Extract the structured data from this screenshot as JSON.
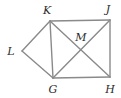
{
  "figure": {
    "type": "geometry-diagram",
    "width": 121,
    "height": 98,
    "background_color": "#ffffff",
    "stroke_color": "#8a8a8a",
    "stroke_width": 1.4,
    "label_color": "#2b2b2b",
    "points": [
      {
        "name": "K",
        "label": "K",
        "x": 50,
        "y": 21,
        "label_x": 47,
        "label_y": 10
      },
      {
        "name": "J",
        "label": "J",
        "x": 110,
        "y": 20,
        "label_x": 108,
        "label_y": 9
      },
      {
        "name": "L",
        "label": "L",
        "x": 22,
        "y": 51,
        "label_x": 11,
        "label_y": 51
      },
      {
        "name": "M",
        "label": "M",
        "x": 81,
        "y": 49,
        "label_x": 81,
        "label_y": 37
      },
      {
        "name": "G",
        "label": "G",
        "x": 53,
        "y": 78,
        "label_x": 53,
        "label_y": 89
      },
      {
        "name": "H",
        "label": "H",
        "x": 110,
        "y": 77,
        "label_x": 110,
        "label_y": 89
      }
    ],
    "segments": [
      {
        "name": "segment-KJ",
        "from": "K",
        "to": "J",
        "x1": 50,
        "y1": 21,
        "x2": 110,
        "y2": 20
      },
      {
        "name": "segment-JH",
        "from": "J",
        "to": "H",
        "x1": 110,
        "y1": 20,
        "x2": 110,
        "y2": 77
      },
      {
        "name": "segment-GH",
        "from": "G",
        "to": "H",
        "x1": 53,
        "y1": 78,
        "x2": 110,
        "y2": 77
      },
      {
        "name": "segment-KG",
        "from": "K",
        "to": "G",
        "x1": 50,
        "y1": 21,
        "x2": 53,
        "y2": 78
      },
      {
        "name": "segment-KH",
        "from": "K",
        "to": "H",
        "x1": 50,
        "y1": 21,
        "x2": 110,
        "y2": 77
      },
      {
        "name": "segment-GJ",
        "from": "G",
        "to": "J",
        "x1": 53,
        "y1": 78,
        "x2": 110,
        "y2": 20
      },
      {
        "name": "segment-LK",
        "from": "L",
        "to": "K",
        "x1": 22,
        "y1": 51,
        "x2": 50,
        "y2": 21
      },
      {
        "name": "segment-LG",
        "from": "L",
        "to": "G",
        "x1": 22,
        "y1": 51,
        "x2": 53,
        "y2": 78
      }
    ]
  }
}
